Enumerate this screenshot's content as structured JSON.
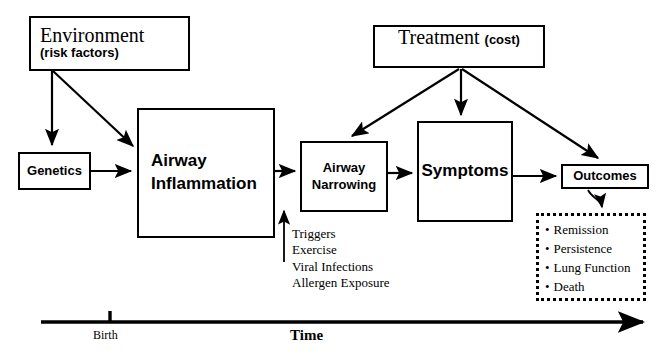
{
  "diagram": {
    "colors": {
      "stroke": "#000000",
      "background": "#ffffff",
      "text": "#000000"
    }
  },
  "nodes": {
    "environment": {
      "line1": "Environment",
      "line2": "(risk factors)"
    },
    "treatment": {
      "line1": "Treatment",
      "line2": "(cost)"
    },
    "genetics": {
      "line1": "Genetics"
    },
    "airway_inflammation": {
      "line1": "Airway",
      "line2": "Inflammation"
    },
    "airway_narrowing": {
      "line1": "Airway",
      "line2": "Narrowing"
    },
    "symptoms": {
      "line1": "Symptoms"
    },
    "outcomes": {
      "line1": "Outcomes"
    }
  },
  "outcome_list": {
    "items": [
      "Remission",
      "Persistence",
      "Lung Function",
      "Death"
    ]
  },
  "triggers": {
    "items": [
      "Triggers",
      "Exercise",
      "Viral Infections",
      "Allergen Exposure"
    ]
  },
  "timeline": {
    "birth_label": "Birth",
    "time_label": "Time"
  },
  "edges": [
    {
      "name": "environment-to-genetics",
      "from": "environment",
      "to": "genetics"
    },
    {
      "name": "environment-to-airway-inflammation",
      "from": "environment",
      "to": "airway_inflammation"
    },
    {
      "name": "genetics-to-airway-inflammation",
      "from": "genetics",
      "to": "airway_inflammation"
    },
    {
      "name": "airway-inflammation-to-airway-narrowing",
      "from": "airway_inflammation",
      "to": "airway_narrowing"
    },
    {
      "name": "airway-narrowing-to-symptoms",
      "from": "airway_narrowing",
      "to": "symptoms"
    },
    {
      "name": "symptoms-to-outcomes",
      "from": "symptoms",
      "to": "outcomes"
    },
    {
      "name": "treatment-to-airway-narrowing",
      "from": "treatment",
      "to": "airway_narrowing"
    },
    {
      "name": "treatment-to-symptoms",
      "from": "treatment",
      "to": "symptoms"
    },
    {
      "name": "treatment-to-outcomes",
      "from": "treatment",
      "to": "outcomes"
    },
    {
      "name": "triggers-to-airway-narrowing",
      "from": "triggers",
      "to": "airway_narrowing"
    },
    {
      "name": "outcomes-to-outcome-list",
      "from": "outcomes",
      "to": "outcome_list"
    }
  ]
}
